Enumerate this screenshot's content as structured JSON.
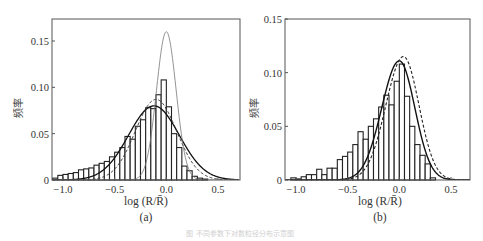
{
  "figure": {
    "caption": "图 不同参数下对数粒径分布示意图"
  },
  "chart_data": [
    {
      "type": "bar",
      "panel_label": "(a)",
      "xlabel": "log (R/R̄)",
      "ylabel": "频率",
      "xlim": [
        -1.15,
        0.7
      ],
      "ylim": [
        0,
        0.17
      ],
      "xticks": [
        -1.0,
        -0.5,
        0.0,
        0.5
      ],
      "xtick_labels": [
        "−1.0",
        "−0.5",
        "0.0",
        "0.5"
      ],
      "yticks": [
        0,
        0.05,
        0.1,
        0.15
      ],
      "ytick_labels": [
        "0",
        "0.05",
        "0.10",
        "0.15"
      ],
      "grid": false,
      "bin_width": 0.05,
      "bin_starts": [
        -1.1,
        -1.05,
        -1.0,
        -0.95,
        -0.9,
        -0.85,
        -0.8,
        -0.75,
        -0.7,
        -0.65,
        -0.6,
        -0.55,
        -0.5,
        -0.45,
        -0.4,
        -0.35,
        -0.3,
        -0.25,
        -0.2,
        -0.15,
        -0.1,
        -0.05,
        0.0,
        0.05,
        0.1,
        0.15,
        0.2,
        0.25,
        0.3,
        0.35
      ],
      "values": [
        0.002,
        0.005,
        0.006,
        0.007,
        0.008,
        0.011,
        0.012,
        0.013,
        0.016,
        0.018,
        0.02,
        0.025,
        0.03,
        0.035,
        0.047,
        0.044,
        0.058,
        0.065,
        0.078,
        0.077,
        0.092,
        0.108,
        0.079,
        0.05,
        0.035,
        0.015,
        0.01,
        0.004,
        0.002,
        0.001
      ],
      "curves": [
        {
          "name": "fit-solid",
          "style": "solid",
          "mu": -0.12,
          "sigma": 0.245,
          "peak": 0.08,
          "color": "#111111",
          "width": 1.3
        },
        {
          "name": "fit-dashed",
          "style": "dashed",
          "mu": -0.1,
          "sigma": 0.2,
          "peak": 0.087,
          "color": "#333333",
          "width": 1.0
        },
        {
          "name": "fit-thin",
          "style": "solid",
          "mu": 0.0,
          "sigma": 0.095,
          "peak": 0.16,
          "color": "#777777",
          "width": 0.8
        }
      ]
    },
    {
      "type": "bar",
      "panel_label": "(b)",
      "xlabel": "log (R/R̄)",
      "ylabel": "频率",
      "xlim": [
        -1.1,
        0.7
      ],
      "ylim": [
        0,
        0.15
      ],
      "xticks": [
        -1.0,
        -0.5,
        0.0,
        0.5
      ],
      "xtick_labels": [
        "−1.0",
        "−0.5",
        "0.0",
        "0.5"
      ],
      "yticks": [
        0,
        0.05,
        0.1,
        0.15
      ],
      "ytick_labels": [
        "0",
        "0.05",
        "0.10",
        "0.15"
      ],
      "grid": false,
      "bin_width": 0.05,
      "bin_starts": [
        -1.05,
        -1.0,
        -0.95,
        -0.9,
        -0.85,
        -0.8,
        -0.75,
        -0.7,
        -0.65,
        -0.6,
        -0.55,
        -0.5,
        -0.45,
        -0.4,
        -0.35,
        -0.3,
        -0.25,
        -0.2,
        -0.15,
        -0.1,
        -0.05,
        0.0,
        0.05,
        0.1,
        0.15,
        0.2,
        0.25,
        0.3
      ],
      "values": [
        0.002,
        0.001,
        0.003,
        0.005,
        0.005,
        0.01,
        0.005,
        0.011,
        0.011,
        0.019,
        0.022,
        0.026,
        0.033,
        0.045,
        0.038,
        0.05,
        0.057,
        0.068,
        0.079,
        0.07,
        0.092,
        0.108,
        0.078,
        0.05,
        0.033,
        0.023,
        0.015,
        0.002
      ],
      "curves": [
        {
          "name": "fit-solid",
          "style": "solid-skew",
          "mode": 0.0,
          "peak": 0.111,
          "sigma_left": 0.17,
          "sigma_right": 0.15,
          "color": "#111111",
          "width": 1.4
        },
        {
          "name": "fit-dashed",
          "style": "dashed-skew",
          "mode": 0.04,
          "peak": 0.115,
          "sigma_left": 0.17,
          "sigma_right": 0.15,
          "color": "#222222",
          "width": 1.1
        }
      ]
    }
  ],
  "panels": [
    {
      "x": 52,
      "y": 19,
      "w": 188,
      "h": 161,
      "x_tick_px": [
        63,
        113,
        170,
        218
      ],
      "y_tick_px": [
        180,
        133,
        87,
        41
      ]
    },
    {
      "x": 285,
      "y": 19,
      "w": 185,
      "h": 161,
      "x_tick_px": [
        296,
        348,
        399,
        451
      ],
      "y_tick_px": [
        180,
        126,
        72,
        19
      ]
    }
  ]
}
